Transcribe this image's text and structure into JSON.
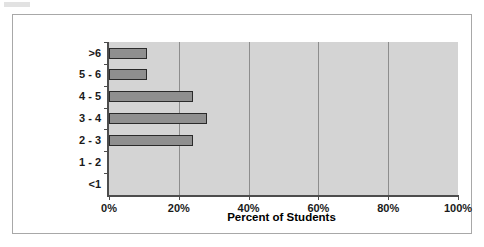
{
  "chart_data": {
    "type": "bar",
    "orientation": "horizontal",
    "title": "",
    "xlabel": "Percent of Students",
    "ylabel": "Time to Perform (hrs)",
    "categories": [
      "<1",
      "1 - 2",
      "2 - 3",
      "3 - 4",
      "4 - 5",
      "5 - 6",
      ">6"
    ],
    "values": [
      0,
      0,
      24,
      28,
      24,
      11,
      11
    ],
    "xlim": [
      0,
      100
    ],
    "xticks": [
      0,
      20,
      40,
      60,
      80,
      100
    ],
    "xticklabels": [
      "0%",
      "20%",
      "40%",
      "60%",
      "80%",
      "100%"
    ],
    "grid": "vertical",
    "legend": "none",
    "bar_color": "#8f8f8f",
    "bar_edge_color": "#2a2a2a",
    "plot_background": "#d4d4d4",
    "axis_color": "#4d4d4d",
    "gridline_color": "#8d8d8d",
    "frame_color": "#a8a8a8"
  }
}
